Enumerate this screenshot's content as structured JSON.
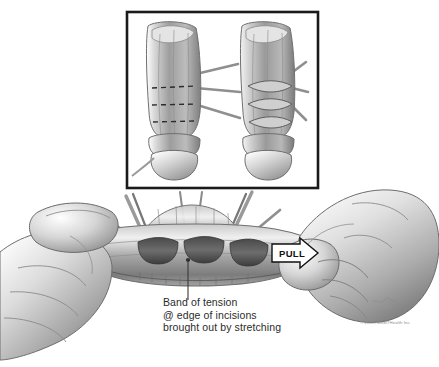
{
  "figure": {
    "background_color": "#ffffff",
    "style": "grayscale-pencil-medical-illustration"
  },
  "inset": {
    "name": "inset-panel",
    "border_color": "#1a1a1a",
    "background_color": "#ffffff",
    "left_view": {
      "label": "incision-lines-view",
      "marking_count": 3,
      "marking_style": "dashed"
    },
    "right_view": {
      "label": "opened-incisions-view",
      "marking_count": 3,
      "marking_style": "open-lens"
    }
  },
  "main_scene": {
    "name": "stretching-maneuver",
    "incision_count": 3,
    "left_hand": "grip-base",
    "right_hand": "grip-distal-pull"
  },
  "pull_arrow": {
    "label": "PULL",
    "direction": "right",
    "fill_color": "#ffffff",
    "outline_color": "#111111"
  },
  "callout": {
    "line1": "Band of tension",
    "line2": "@ edge of incisions",
    "line3": "brought out by stretching",
    "leader_color": "#3a3a3a"
  },
  "credits": {
    "copyright": "© 2005, MedlTHealth Inc.",
    "signature": "artist-signature"
  }
}
